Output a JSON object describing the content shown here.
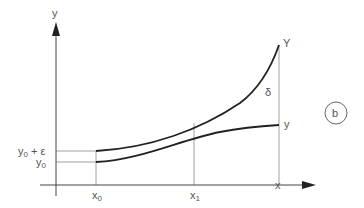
{
  "diagram": {
    "panel_label": "b",
    "axes": {
      "y_label": "y",
      "x_label": "x"
    },
    "labels": {
      "upper_curve": "Y",
      "lower_curve": "y",
      "gap": "δ",
      "y0_eps": "y",
      "y0_eps_sub": "0",
      "y0_eps_tail": " + ε",
      "y0": "y",
      "y0_sub": "0",
      "x0": "x",
      "x0_sub": "0",
      "x1": "x",
      "x1_sub": "1"
    },
    "colors": {
      "curve": "#222222",
      "axis": "#444444",
      "guide": "#888888",
      "text": "#555555"
    }
  }
}
